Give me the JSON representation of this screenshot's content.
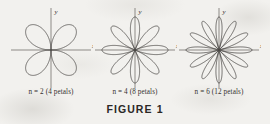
{
  "figure": {
    "caption": "FIGURE 1",
    "background_color": "#f2f1ee",
    "curve_color": "#4a4745",
    "axis_color": "#8d8a86",
    "text_color": "#35322f"
  },
  "axes_labels": {
    "x": "x",
    "y": "y"
  },
  "plots": [
    {
      "label": "n = 2 (4 petals)",
      "n": 2,
      "petals": 4,
      "equation": "r = cos(nθ)",
      "axis_x_label": "x",
      "axis_y_label": "y"
    },
    {
      "label": "n = 4 (8 petals)",
      "n": 4,
      "petals": 8,
      "equation": "r = cos(nθ)",
      "axis_x_label": "x",
      "axis_y_label": "y"
    },
    {
      "label": "n = 6 (12 petals)",
      "n": 6,
      "petals": 12,
      "equation": "r = cos(nθ)",
      "axis_x_label": "x",
      "axis_y_label": "y"
    }
  ],
  "chart_data": {
    "type": "line",
    "title": "FIGURE 1",
    "xlabel": "x",
    "ylabel": "y",
    "coordinate_system": "polar",
    "grid": false,
    "legend": false,
    "series": [
      {
        "name": "n = 2 (4 petals)",
        "equation": "r = cos(2θ)",
        "petal_count": 4,
        "petal_angles_deg": [
          45,
          135,
          225,
          315
        ],
        "petal_half_width_deg": 45,
        "max_radius": 1
      },
      {
        "name": "n = 4 (8 petals)",
        "equation": "r = cos(4θ)",
        "petal_count": 8,
        "petal_angles_deg": [
          90,
          135,
          180,
          225,
          270,
          315,
          0,
          45
        ],
        "petal_half_width_deg": 22.5,
        "max_radius": 1
      },
      {
        "name": "n = 6 (12 petals)",
        "equation": "r = cos(6θ)",
        "petal_count": 12,
        "petal_angles_deg": [
          90,
          120,
          150,
          180,
          210,
          240,
          270,
          300,
          330,
          0,
          30,
          60
        ],
        "petal_half_width_deg": 15,
        "max_radius": 1
      }
    ]
  }
}
